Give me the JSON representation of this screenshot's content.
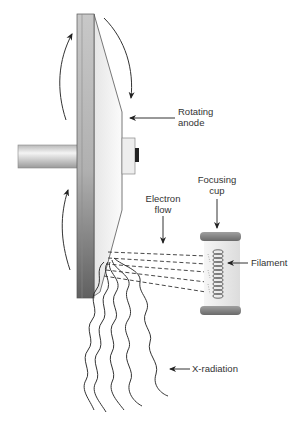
{
  "diagram": {
    "labels": {
      "rotating_anode_line1": "Rotating",
      "rotating_anode_line2": "anode",
      "focusing_cup_line1": "Focusing",
      "focusing_cup_line2": "cup",
      "electron_flow_line1": "Electron",
      "electron_flow_line2": "flow",
      "filament": "Filament",
      "x_radiation": "X-radiation"
    },
    "colors": {
      "line": "#333333",
      "disk_dark": "#777777",
      "disk_light": "#d8d8d8",
      "cup": "#8a8a8a"
    }
  }
}
